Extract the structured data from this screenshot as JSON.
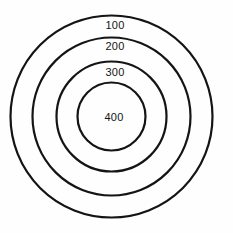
{
  "figure": {
    "title": "",
    "background_color": "#fefefe",
    "stroke_color": "#141414",
    "text_color": "#141414"
  },
  "chart_data": {
    "type": "diagram",
    "subtype": "concentric-circles-target",
    "title": "",
    "xlabel": "",
    "ylabel": "",
    "center": {
      "x": 111.5,
      "y": 116.5
    },
    "units": "px",
    "rings": [
      {
        "label": "100",
        "radius": 101,
        "label_x": 115,
        "label_y": 25,
        "stroke_width": 2.2
      },
      {
        "label": "200",
        "radius": 79,
        "label_x": 115,
        "label_y": 46,
        "stroke_width": 2.2
      },
      {
        "label": "300",
        "radius": 55,
        "label_x": 115,
        "label_y": 72,
        "stroke_width": 2.2
      },
      {
        "label": "400",
        "radius": 34,
        "label_x": 114,
        "label_y": 117,
        "stroke_width": 2.2
      }
    ],
    "values": [
      100,
      200,
      300,
      400
    ],
    "categories": [
      "100",
      "200",
      "300",
      "400"
    ],
    "fill": "none",
    "grid": false,
    "legend": false
  },
  "labels": {
    "ring1": "100",
    "ring2": "200",
    "ring3": "300",
    "ring4": "400"
  }
}
